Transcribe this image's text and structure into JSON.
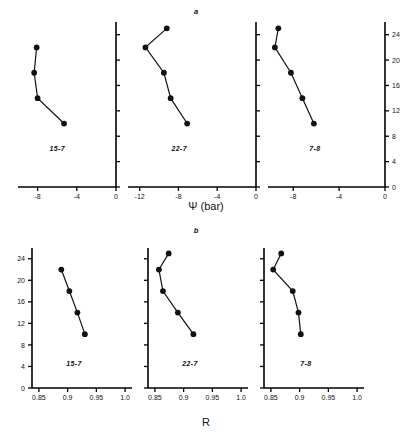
{
  "figure": {
    "section_a_letter": "a",
    "section_b_letter": "b",
    "axis_title_a": "Ψ (bar)",
    "axis_title_b": "R"
  },
  "chart_data": [
    {
      "type": "line",
      "id": "a1",
      "title": "15-7",
      "xlabel": "Ψ (bar)",
      "ylabel": "",
      "xlim": [
        -10,
        0
      ],
      "ylim": [
        0,
        26
      ],
      "xticks": [
        -8,
        -4,
        0
      ],
      "xticklabels": [
        "-8",
        "-4",
        "0"
      ],
      "yticks": [
        0,
        4,
        8,
        12,
        16,
        20,
        24
      ],
      "yticklabels": [
        "",
        "",
        "",
        "",
        "",
        "",
        ""
      ],
      "grid": false,
      "legend": "none",
      "x": [
        -8.1,
        -8.35,
        -8.0,
        -5.3
      ],
      "y": [
        22.0,
        18.0,
        14.0,
        10.0
      ]
    },
    {
      "type": "line",
      "id": "a2",
      "title": "22-7",
      "xlabel": "Ψ (bar)",
      "ylabel": "",
      "xlim": [
        -13.2,
        0
      ],
      "ylim": [
        0,
        26
      ],
      "xticks": [
        -12,
        -8,
        -4,
        0
      ],
      "xticklabels": [
        "-12",
        "-8",
        "-4",
        "0"
      ],
      "yticks": [
        0,
        4,
        8,
        12,
        16,
        20,
        24
      ],
      "yticklabels": [
        "",
        "",
        "",
        "",
        "",
        "",
        ""
      ],
      "grid": false,
      "legend": "none",
      "x": [
        -9.2,
        -11.4,
        -9.5,
        -8.8,
        -7.1
      ],
      "y": [
        25.0,
        22.0,
        18.0,
        14.0,
        10.0
      ]
    },
    {
      "type": "line",
      "id": "a3",
      "title": "7-8",
      "xlabel": "Ψ (bar)",
      "ylabel": "Depth",
      "xlim": [
        -10.2,
        0
      ],
      "ylim": [
        0,
        26
      ],
      "xticks": [
        -8,
        -4,
        0
      ],
      "xticklabels": [
        "-8",
        "-4",
        "0"
      ],
      "yticks": [
        0,
        4,
        8,
        12,
        16,
        20,
        24
      ],
      "yticklabels": [
        "0",
        "4",
        "8",
        "12",
        "16",
        "20",
        "24"
      ],
      "grid": false,
      "legend": "none",
      "x": [
        -9.3,
        -9.6,
        -8.2,
        -7.2,
        -6.2
      ],
      "y": [
        25.0,
        22.0,
        18.0,
        14.0,
        10.0
      ]
    },
    {
      "type": "line",
      "id": "b1",
      "title": "15-7",
      "xlabel": "R",
      "ylabel": "Depth",
      "xlim": [
        0.838,
        1.012
      ],
      "ylim": [
        0,
        26
      ],
      "xticks": [
        0.85,
        0.9,
        0.95,
        1.0
      ],
      "xticklabels": [
        "0.85",
        "0.9",
        "0.95",
        "1.0"
      ],
      "yticks": [
        0,
        4,
        8,
        12,
        16,
        20,
        24
      ],
      "yticklabels": [
        "0",
        "4",
        "8",
        "12",
        "16",
        "20",
        "24"
      ],
      "grid": false,
      "legend": "none",
      "x": [
        0.889,
        0.903,
        0.917,
        0.93
      ],
      "y": [
        22.0,
        18.0,
        14.0,
        10.0
      ]
    },
    {
      "type": "line",
      "id": "b2",
      "title": "22-7",
      "xlabel": "R",
      "ylabel": "",
      "xlim": [
        0.838,
        1.012
      ],
      "ylim": [
        0,
        26
      ],
      "xticks": [
        0.85,
        0.9,
        0.95,
        1.0
      ],
      "xticklabels": [
        "0.85",
        "0.9",
        "0.95",
        "1.0"
      ],
      "yticks": [
        0,
        4,
        8,
        12,
        16,
        20,
        24
      ],
      "yticklabels": [
        "",
        "",
        "",
        "",
        "",
        "",
        ""
      ],
      "grid": false,
      "legend": "none",
      "x": [
        0.874,
        0.857,
        0.864,
        0.89,
        0.917
      ],
      "y": [
        25.0,
        22.0,
        18.0,
        14.0,
        10.0
      ]
    },
    {
      "type": "line",
      "id": "b3",
      "title": "7-8",
      "xlabel": "R",
      "ylabel": "",
      "xlim": [
        0.838,
        1.012
      ],
      "ylim": [
        0,
        26
      ],
      "xticks": [
        0.85,
        0.9,
        0.95,
        1.0
      ],
      "xticklabels": [
        "0.85",
        "0.9",
        "0.95",
        "1.0"
      ],
      "yticks": [
        0,
        4,
        8,
        12,
        16,
        20,
        24
      ],
      "yticklabels": [
        "",
        "",
        "",
        "",
        "",
        "",
        ""
      ],
      "grid": false,
      "legend": "none",
      "x": [
        0.868,
        0.854,
        0.888,
        0.898,
        0.902
      ],
      "y": [
        25.0,
        22.0,
        18.0,
        14.0,
        10.0
      ]
    }
  ],
  "layout": {
    "panels_a": [
      {
        "chart": 0,
        "x": 18,
        "y": 22,
        "w": 98,
        "h": 165,
        "yaxis_side": "right",
        "yaxis_labels": false
      },
      {
        "chart": 1,
        "x": 128,
        "y": 22,
        "w": 128,
        "h": 165,
        "yaxis_side": "right",
        "yaxis_labels": false
      },
      {
        "chart": 2,
        "x": 268,
        "y": 22,
        "w": 117,
        "h": 165,
        "yaxis_side": "right",
        "yaxis_labels": true
      }
    ],
    "panels_b": [
      {
        "chart": 3,
        "x": 32,
        "y": 248,
        "w": 100,
        "h": 140,
        "yaxis_side": "left",
        "yaxis_labels": true
      },
      {
        "chart": 4,
        "x": 148,
        "y": 248,
        "w": 100,
        "h": 140,
        "yaxis_side": "left",
        "yaxis_labels": false
      },
      {
        "chart": 5,
        "x": 264,
        "y": 248,
        "w": 100,
        "h": 140,
        "yaxis_side": "left",
        "yaxis_labels": false
      }
    ],
    "letter_a_pos": {
      "x": 196,
      "y": 14
    },
    "letter_b_pos": {
      "x": 196,
      "y": 233
    },
    "title_a_pos": {
      "x": 206,
      "y": 210
    },
    "title_b_pos": {
      "x": 206,
      "y": 426
    }
  }
}
